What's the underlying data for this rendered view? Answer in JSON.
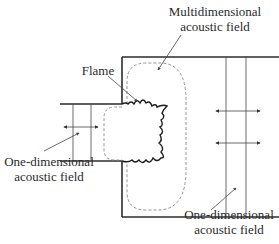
{
  "diagram": {
    "labels": {
      "multidimensional": {
        "line1": "Multidimensional",
        "line2": "acoustic field"
      },
      "flame": "Flame",
      "one_dimensional_inlet": {
        "line1": "One-dimensional",
        "line2": "acoustic field"
      },
      "one_dimensional_chamber": {
        "line1": "One-dimensional",
        "line2": "acoustic field"
      }
    },
    "elements": [
      "inlet-duct",
      "combustion-chamber",
      "flame-front",
      "multidimensional-field-boundary",
      "inlet-plane-wave-region",
      "chamber-plane-wave-region",
      "double-headed-arrows"
    ],
    "colors": {
      "wall": "#2b2b2b",
      "thin_line": "#444444",
      "dashed": "#8a8a8a",
      "text": "#2a2a2a"
    }
  }
}
